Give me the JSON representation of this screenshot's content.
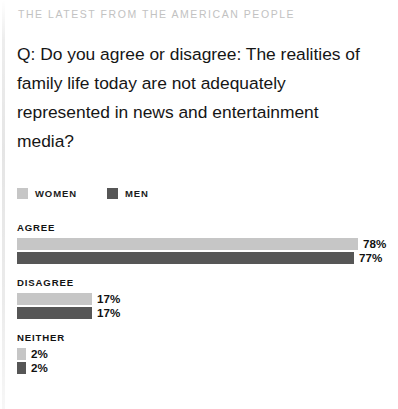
{
  "kicker": "THE LATEST FROM THE AMERICAN PEOPLE",
  "question": "Q: Do you agree or disagree: The realities of family life today are not adequately represented in news and entertainment media?",
  "legend": {
    "items": [
      {
        "label": "WOMEN",
        "color": "#c6c6c6",
        "swatch_name": "legend-swatch-women"
      },
      {
        "label": "MEN",
        "color": "#565656",
        "swatch_name": "legend-swatch-men"
      }
    ]
  },
  "chart_data": {
    "type": "bar",
    "orientation": "horizontal",
    "title": "Q: Do you agree or disagree: The realities of family life today are not adequately represented in news and entertainment media?",
    "subtitle": "THE LATEST FROM THE AMERICAN PEOPLE",
    "categories": [
      "AGREE",
      "DISAGREE",
      "NEITHER"
    ],
    "series": [
      {
        "name": "WOMEN",
        "color": "#c6c6c6",
        "values": [
          78,
          17,
          2
        ],
        "value_labels": [
          "78%",
          "17%",
          "2%"
        ]
      },
      {
        "name": "MEN",
        "color": "#565656",
        "values": [
          77,
          17,
          2
        ],
        "value_labels": [
          "77%",
          "17%",
          "2%"
        ]
      }
    ],
    "unit": "%",
    "xlabel": "",
    "ylabel": "",
    "xlim": [
      0,
      78
    ],
    "grid": false,
    "legend_position": "top-left",
    "groups": [
      {
        "label": "AGREE",
        "bars": [
          {
            "series": "WOMEN",
            "value": 78,
            "value_label": "78%",
            "color": "#c6c6c6",
            "width_px": 341
          },
          {
            "series": "MEN",
            "value": 77,
            "value_label": "77%",
            "color": "#565656",
            "width_px": 337
          }
        ]
      },
      {
        "label": "DISAGREE",
        "bars": [
          {
            "series": "WOMEN",
            "value": 17,
            "value_label": "17%",
            "color": "#c6c6c6",
            "width_px": 75
          },
          {
            "series": "MEN",
            "value": 17,
            "value_label": "17%",
            "color": "#565656",
            "width_px": 75
          }
        ]
      },
      {
        "label": "NEITHER",
        "bars": [
          {
            "series": "WOMEN",
            "value": 2,
            "value_label": "2%",
            "color": "#c6c6c6",
            "width_px": 9
          },
          {
            "series": "MEN",
            "value": 2,
            "value_label": "2%",
            "color": "#565656",
            "width_px": 9
          }
        ]
      }
    ]
  }
}
